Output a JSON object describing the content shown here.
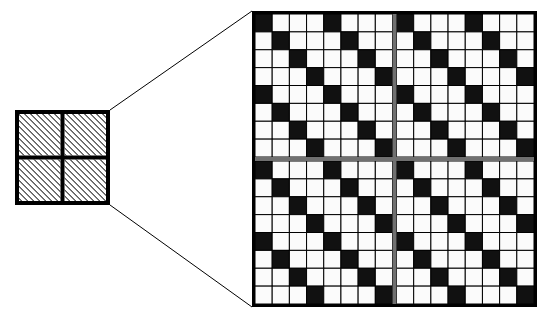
{
  "figure": {
    "background_color": "#ffffff",
    "ink_color": "#000000",
    "divider_color": "#6f6f6f",
    "canvas": {
      "width": 545,
      "height": 316
    }
  },
  "source_panel": {
    "name": "source-tile",
    "label": "",
    "x": 15,
    "y": 110,
    "width": 95,
    "height": 95,
    "rows": 2,
    "cols": 2,
    "outer_border_px": 4,
    "inner_border_px": 4,
    "fill_style": "diagonal-hatch",
    "hatch_angle_deg": 45,
    "hatch_spacing_px": 3,
    "hatch_line_width_px": 1,
    "hatch_color": "#000000",
    "cell_background": "#ffffff"
  },
  "zoom_lines": {
    "name": "magnification-cone",
    "color": "#000000",
    "line_width_px": 1,
    "segments": [
      {
        "name": "upper-zoom-line",
        "x1": 110,
        "y1": 110,
        "x2": 252,
        "y2": 11
      },
      {
        "name": "lower-zoom-line",
        "x1": 110,
        "y1": 205,
        "x2": 252,
        "y2": 307
      }
    ]
  },
  "zoom_panel": {
    "name": "magnified-lattice",
    "label": "",
    "x": 252,
    "y": 11,
    "width": 285,
    "height": 296,
    "rows": 16,
    "cols": 16,
    "quadrants": 4,
    "quadrant_rows": 8,
    "quadrant_cols": 8,
    "outer_border_px": 3,
    "grid_line_px": 1,
    "grid_line_color": "#000000",
    "center_divider_px": 4,
    "center_divider_color": "#707070",
    "black_cell_color": "#111111",
    "white_cell_color": "#fbfbfb",
    "pattern_rule": "black when (col - row) mod 4 == 0 within each 8x8 quadrant",
    "pattern_period": 4,
    "quadrant_pattern": [
      [
        1,
        0,
        0,
        0,
        1,
        0,
        0,
        0
      ],
      [
        0,
        1,
        0,
        0,
        0,
        1,
        0,
        0
      ],
      [
        0,
        0,
        1,
        0,
        0,
        0,
        1,
        0
      ],
      [
        0,
        0,
        0,
        1,
        0,
        0,
        0,
        1
      ],
      [
        1,
        0,
        0,
        0,
        1,
        0,
        0,
        0
      ],
      [
        0,
        1,
        0,
        0,
        0,
        1,
        0,
        0
      ],
      [
        0,
        0,
        1,
        0,
        0,
        0,
        1,
        0
      ],
      [
        0,
        0,
        0,
        1,
        0,
        0,
        0,
        1
      ]
    ]
  }
}
